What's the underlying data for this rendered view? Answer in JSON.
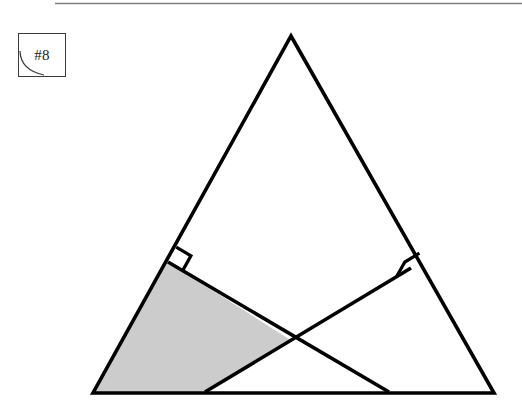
{
  "page": {
    "width": 522,
    "height": 408,
    "background_color": "#ffffff"
  },
  "top_rule": {
    "name": "top-horizontal-rule",
    "color": "#808080",
    "y": 3.5,
    "x1": 55,
    "x2": 522,
    "thickness": 1.6
  },
  "problem_label": {
    "text": "#8",
    "box": {
      "x": 18,
      "y": 33,
      "width": 48,
      "height": 44
    },
    "border_color": "#3a3a3a",
    "text_color": "#1a1a1a",
    "curl_icon_name": "page-curl-arc-icon"
  },
  "figure": {
    "stroke_color": "#000000",
    "stroke_width": 3.6,
    "shade_color": "#cccccc",
    "vertices": {
      "apex": {
        "label": "A",
        "x": 291,
        "y": 36
      },
      "bottom_left": {
        "label": "B",
        "x": 93,
        "y": 393
      },
      "bottom_right": {
        "label": "C",
        "x": 494,
        "y": 393
      }
    },
    "cevians": [
      {
        "name": "altitude-from-base-right-to-left-side",
        "foot": {
          "x": 168,
          "y": 262
        },
        "base_point": {
          "x": 389,
          "y": 392
        },
        "right_angle_mark": true
      },
      {
        "name": "altitude-from-base-left-to-right-side",
        "foot": {
          "x": 411,
          "y": 268
        },
        "base_point": {
          "x": 205,
          "y": 392
        },
        "right_angle_mark": true
      }
    ],
    "intersection_point": {
      "x": 292,
      "y": 341
    },
    "shaded_region": {
      "name": "shaded-quadrilateral",
      "points": [
        {
          "x": 93,
          "y": 393
        },
        {
          "x": 168,
          "y": 262
        },
        {
          "x": 292,
          "y": 341
        },
        {
          "x": 205,
          "y": 392
        }
      ]
    },
    "right_angle_marks": [
      {
        "name": "right-angle-mark-left",
        "vertex": {
          "x": 168,
          "y": 262
        },
        "size": 17,
        "dir_a": {
          "x": 0.4855,
          "y": -0.8742
        },
        "dir_b": {
          "x": 0.8617,
          "y": 0.5074
        }
      },
      {
        "name": "right-angle-mark-right",
        "vertex": {
          "x": 411,
          "y": 268
        },
        "size": 17,
        "dir_a": {
          "x": 0.4943,
          "y": -0.8693
        },
        "dir_b": {
          "x": -0.8556,
          "y": 0.5176
        }
      }
    ]
  }
}
